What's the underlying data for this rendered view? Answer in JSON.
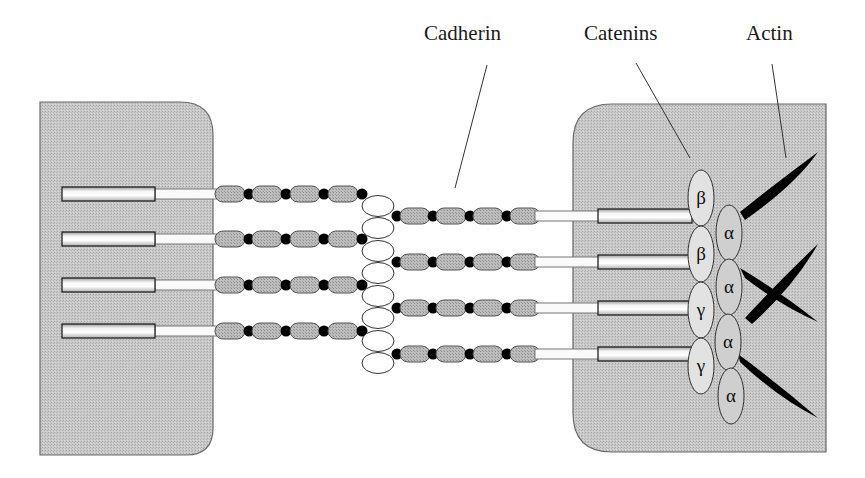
{
  "labels": {
    "cadherin": "Cadherin",
    "catenins": "Catenins",
    "actin": "Actin"
  },
  "catenins": [
    {
      "symbol": "β",
      "cx": 701,
      "cy": 198
    },
    {
      "symbol": "α",
      "cx": 729,
      "cy": 233
    },
    {
      "symbol": "β",
      "cx": 701,
      "cy": 254
    },
    {
      "symbol": "α",
      "cx": 729,
      "cy": 287
    },
    {
      "symbol": "γ",
      "cx": 701,
      "cy": 310
    },
    {
      "symbol": "α",
      "cx": 728,
      "cy": 342
    },
    {
      "symbol": "γ",
      "cx": 701,
      "cy": 366
    },
    {
      "symbol": "α",
      "cx": 731,
      "cy": 396
    }
  ],
  "colors": {
    "cell": "#c4c4c4",
    "cell_border": "#6a6a6a",
    "bead": "#b8b8b8",
    "dot": "#000000",
    "catenin": "#dcdcdc",
    "actin": "#000000"
  }
}
